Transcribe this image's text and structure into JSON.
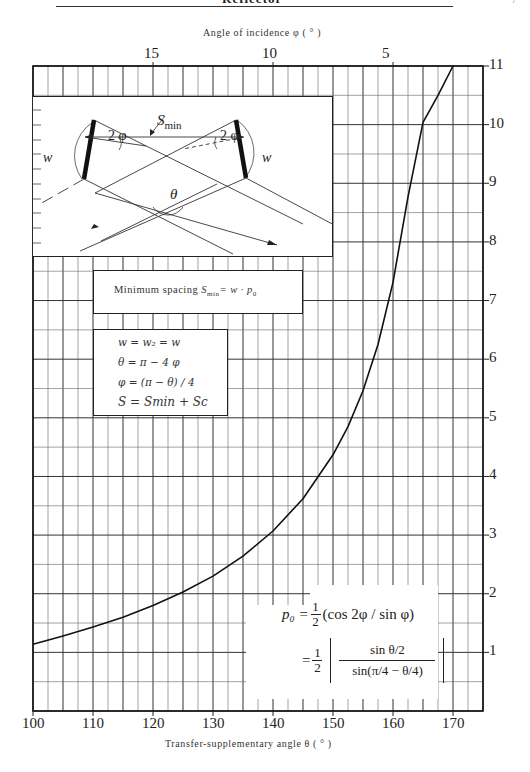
{
  "header": {
    "running_title": "Reflector",
    "page_number": "7"
  },
  "chart_data": {
    "type": "line",
    "title": "",
    "xlabel": "Transfer-supplementary angle θ ( ° )",
    "ylabel": "p0",
    "top_xlabel": "Angle of incidence φ ( ° )",
    "xlim": [
      100,
      175
    ],
    "ylim": [
      0,
      11
    ],
    "grid": true,
    "grid_x_step": 2.5,
    "grid_y_step": 0.5,
    "x_ticks": [
      100,
      110,
      120,
      130,
      140,
      150,
      160,
      170
    ],
    "x_tick_labels": [
      "100",
      "110",
      "120",
      "130",
      "140",
      "150",
      "160",
      "170"
    ],
    "y_ticks": [
      1,
      2,
      3,
      4,
      5,
      6,
      7,
      8,
      9,
      10,
      11
    ],
    "y_tick_labels": [
      "1",
      "2",
      "3",
      "4",
      "5",
      "6",
      "7",
      "8",
      "9",
      "10",
      "11"
    ],
    "y_axis_side": "right",
    "top_ticks_theta": [
      120,
      140,
      160
    ],
    "top_tick_labels": [
      "15",
      "10",
      "5"
    ],
    "series": [
      {
        "name": "p0 = 1/2 · sin(θ/2) / sin(π/4 − θ/4)",
        "x": [
          100,
          105,
          110,
          115,
          120,
          125,
          130,
          135,
          140,
          145,
          150,
          152.5,
          155,
          157.5,
          160,
          162.5,
          165,
          167.5,
          170
        ],
        "values": [
          1.14,
          1.28,
          1.43,
          1.6,
          1.8,
          2.03,
          2.3,
          2.64,
          3.07,
          3.62,
          4.37,
          4.85,
          5.46,
          6.25,
          7.31,
          8.77,
          10.04,
          10.5,
          11.0
        ]
      }
    ]
  },
  "diagram": {
    "labels": {
      "w_left": "w",
      "w_right": "w",
      "two_phi_left": "2 φ",
      "two_phi_right": "2 φ",
      "s_min": "S",
      "s_min_sub": "min",
      "theta": "θ"
    }
  },
  "boxes": {
    "min_spacing": {
      "text": "Minimum spacing ",
      "formula_s": "S",
      "formula_sub": "min",
      "formula_rest": "= w · p",
      "formula_p_sub": "0"
    },
    "relations": [
      "w = w₂ = w",
      "θ = π − 4 φ",
      "φ = (π − θ) / 4",
      "S = Smin + Sc"
    ],
    "p0_formula": {
      "line1_lhs": "p₀ =",
      "line1_frac_num": "1",
      "line1_frac_den": "2",
      "line1_rest": "(cos 2φ / sin φ)",
      "line2_eq": "=",
      "line2_frac_num": "1",
      "line2_frac_den": "2",
      "line2_inner_num": "sin θ/2",
      "line2_inner_den": "sin(π/4 − θ/4)"
    }
  }
}
